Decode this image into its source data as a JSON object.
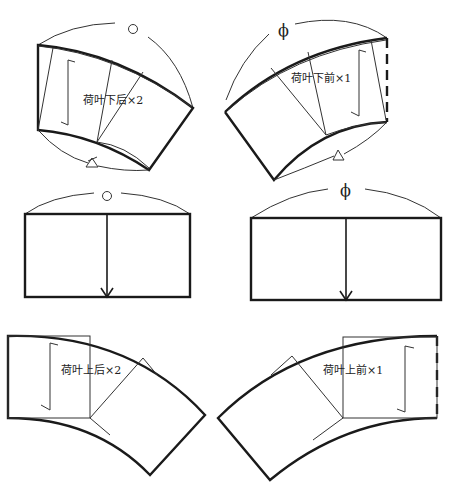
{
  "diagram": {
    "type": "sewing-pattern",
    "colors": {
      "line": "#1a1a1a",
      "background": "#ffffff"
    },
    "pieces": [
      {
        "id": "lower-back",
        "label": "荷叶下后×2",
        "notch_symbol": "circle",
        "bottom_mark": "triangle",
        "has_grain_line": true
      },
      {
        "id": "lower-front",
        "label": "荷叶下前×1",
        "notch_symbol": "phi",
        "phi_glyph": "ϕ",
        "bottom_mark": "triangle",
        "has_grain_line": true,
        "fold_edge": "dashed-right"
      },
      {
        "id": "rect-back",
        "notch_symbol": "circle",
        "arrow": "down"
      },
      {
        "id": "rect-front",
        "notch_symbol": "phi",
        "phi_glyph": "ϕ",
        "arrow": "down"
      },
      {
        "id": "upper-back",
        "label": "荷叶上后×2",
        "has_grain_line": true
      },
      {
        "id": "upper-front",
        "label": "荷叶上前×1",
        "has_grain_line": true,
        "fold_edge": "dashed-right"
      }
    ]
  }
}
